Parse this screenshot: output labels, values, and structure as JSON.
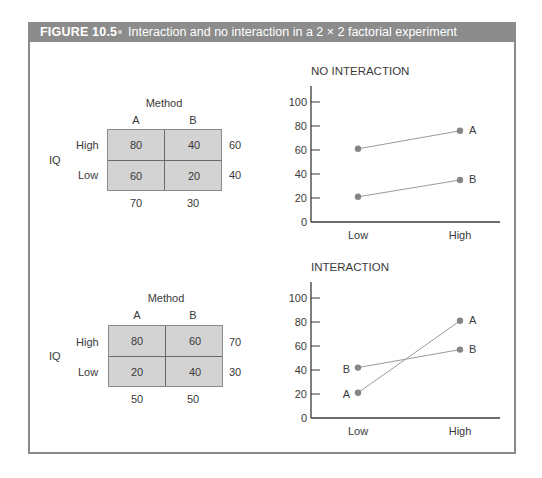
{
  "figure": {
    "label": "FIGURE 10.5",
    "caption": "Interaction and no interaction in a 2 × 2 factorial experiment"
  },
  "tables": [
    {
      "factor_col": "Method",
      "factor_row": "IQ",
      "col_labels": [
        "A",
        "B"
      ],
      "row_labels": [
        "High",
        "Low"
      ],
      "cells": [
        [
          "80",
          "40"
        ],
        [
          "60",
          "20"
        ]
      ],
      "row_means": [
        "60",
        "40"
      ],
      "col_means": [
        "70",
        "30"
      ]
    },
    {
      "factor_col": "Method",
      "factor_row": "IQ",
      "col_labels": [
        "A",
        "B"
      ],
      "row_labels": [
        "High",
        "Low"
      ],
      "cells": [
        [
          "80",
          "60"
        ],
        [
          "20",
          "40"
        ]
      ],
      "row_means": [
        "70",
        "30"
      ],
      "col_means": [
        "50",
        "50"
      ]
    }
  ],
  "chart_data": [
    {
      "type": "line",
      "title": "NO INTERACTION",
      "categories": [
        "Low",
        "High"
      ],
      "series": [
        {
          "name": "A",
          "values": [
            61,
            76
          ]
        },
        {
          "name": "B",
          "values": [
            21,
            35
          ]
        }
      ],
      "xlabel": "",
      "ylabel": "",
      "ylim": [
        0,
        100
      ],
      "yticks": [
        "0",
        "20",
        "40",
        "60",
        "80",
        "100"
      ],
      "grid": false,
      "legend": "inline labels at line ends"
    },
    {
      "type": "line",
      "title": "INTERACTION",
      "categories": [
        "Low",
        "High"
      ],
      "series": [
        {
          "name": "A",
          "values": [
            21,
            81
          ]
        },
        {
          "name": "B",
          "values": [
            42,
            57
          ]
        }
      ],
      "xlabel": "",
      "ylabel": "",
      "ylim": [
        0,
        100
      ],
      "yticks": [
        "0",
        "20",
        "40",
        "60",
        "80",
        "100"
      ],
      "grid": false,
      "legend": "inline labels at line ends"
    }
  ],
  "colors": {
    "titlebar": "#8c8c8c",
    "cell_fill": "#d3d3d3",
    "line": "#9a9a9a",
    "point": "#858585",
    "axis": "#3a3a3a"
  }
}
